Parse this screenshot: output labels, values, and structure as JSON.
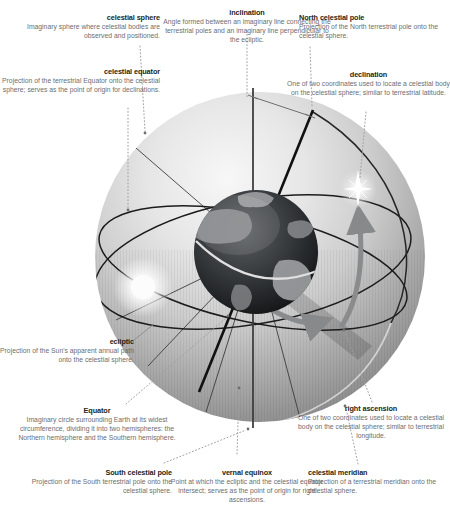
{
  "figure": {
    "type": "labeled-diagram",
    "elements": {
      "sphere": "celestial-sphere-graphic",
      "earth": "earth-globe",
      "sun": "sun-glyph",
      "star": "star-glyph",
      "equator_arrow": "right-ascension-arrow",
      "declination_arrow": "declination-arrow"
    }
  },
  "colors": {
    "title_text": "#231f20",
    "description_text": "#6d6e71",
    "leader_line": "#a0a0a2",
    "axis_line": "#3f3f3f",
    "circle_line": "#1c1c1c",
    "arrow_gray": "#898b8d",
    "sphere_light": "#f6f6f6",
    "sphere_dark": "#8f8f8f"
  },
  "annotations": [
    {
      "id": "celestial-sphere",
      "title": "celestial sphere",
      "description": "Imaginary sphere where celestial bodies are observed and positioned."
    },
    {
      "id": "inclination",
      "title": "inclination",
      "description": "Angle formed between an imaginary line connecting the terrestrial poles and an imaginary line perpendicular to the ecliptic."
    },
    {
      "id": "north-celestial-pole",
      "title": "North celestial pole",
      "description": "Projection of the North terrestrial pole onto the celestial sphere."
    },
    {
      "id": "celestial-equator",
      "title": "celestial equator",
      "description": "Projection of the terrestrial Equator onto the celestial sphere; serves as the point of origin for declinations."
    },
    {
      "id": "declination",
      "title": "declination",
      "description": "One of two coordinates used to locate a celestial body on the celestial sphere; similar to terrestrial latitude."
    },
    {
      "id": "ecliptic",
      "title": "ecliptic",
      "description": "Projection of the Sun's apparent annual path onto the celestial sphere."
    },
    {
      "id": "equator",
      "title": "Equator",
      "description": "Imaginary circle surrounding Earth at its widest circumference, dividing it into two hemispheres: the Northern hemisphere and the Southern hemisphere."
    },
    {
      "id": "right-ascension",
      "title": "right ascension",
      "description": "One of two coordinates used to locate a celestial body on the celestial sphere; similar to terrestrial longitude."
    },
    {
      "id": "south-celestial-pole",
      "title": "South celestial pole",
      "description": "Projection of the South terrestrial pole onto the celestial sphere."
    },
    {
      "id": "vernal-equinox",
      "title": "vernal equinox",
      "description": "Point at which the ecliptic and the celestial equator intersect; serves as the point of origin for right ascensions."
    },
    {
      "id": "celestial-meridian",
      "title": "celestial meridian",
      "description": "Projection of a terrestrial meridian onto the celestial sphere."
    }
  ]
}
